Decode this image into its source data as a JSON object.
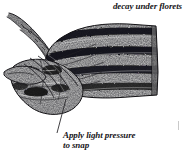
{
  "figure": {
    "kind": "line-engraving illustration",
    "background_color": "#ffffff",
    "ink_color": "#17161a",
    "midtone_color": "#8d8d8d"
  },
  "annotations": {
    "top_right": "decay under florets",
    "caption_line_1": "Apply light pressure",
    "caption_line_2": "to snap"
  },
  "leader_line": {
    "from_x": 66,
    "from_y": 99,
    "to_x": 57,
    "to_y": 133,
    "color": "#2b2a2e"
  },
  "scan_artifact": {
    "x": 178,
    "y": 121,
    "color": "#c9c9c9"
  }
}
